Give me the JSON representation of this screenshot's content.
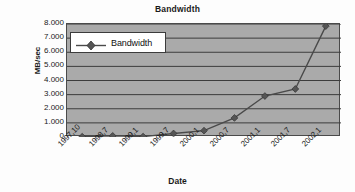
{
  "chart_data": {
    "type": "line",
    "title": "Bandwidth",
    "xlabel": "Date",
    "ylabel": "MB/sec",
    "grid": true,
    "legend_position": "top-left-inside",
    "series": [
      {
        "name": "Bandwidth",
        "marker": "diamond",
        "values": [
          0.02,
          0.08,
          0.03,
          0.25,
          0.45,
          1.35,
          2.9,
          3.4,
          7.85
        ]
      }
    ],
    "categories": [
      "1997,10",
      "1998,7",
      "1999,1",
      "1999,7",
      "2000,1",
      "2000,7",
      "2001,1",
      "2001,7",
      "2002,1"
    ],
    "ylim": [
      0,
      8
    ],
    "ytick_labels": [
      "0",
      "1.000",
      "2.000",
      "3.000",
      "4.000",
      "5.000",
      "6.000",
      "7.000",
      "8.000"
    ],
    "ytick_values": [
      0,
      1,
      2,
      3,
      4,
      5,
      6,
      7,
      8
    ],
    "colors": {
      "plot_background": "#aaaaaa",
      "gridline": "#3c3c3c",
      "series_line": "#4a4a4a",
      "marker": "#555555",
      "legend_background": "#ffffff",
      "text": "#1a1a1a"
    }
  }
}
